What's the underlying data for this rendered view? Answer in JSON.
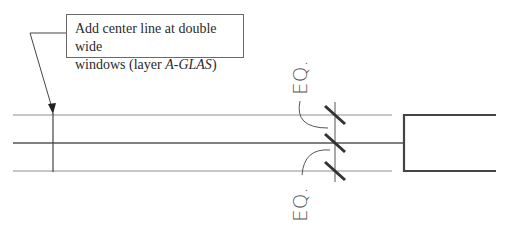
{
  "callout": {
    "line1": "Add center line at double wide",
    "line2_prefix": "windows (layer ",
    "layer_name": "A-GLAS",
    "line2_suffix": ")"
  },
  "dimensions": {
    "upper_label": "EQ.",
    "lower_label": "EQ."
  },
  "colors": {
    "line": "#555555",
    "thin_line": "#9a9a9a",
    "tick": "#333333"
  }
}
